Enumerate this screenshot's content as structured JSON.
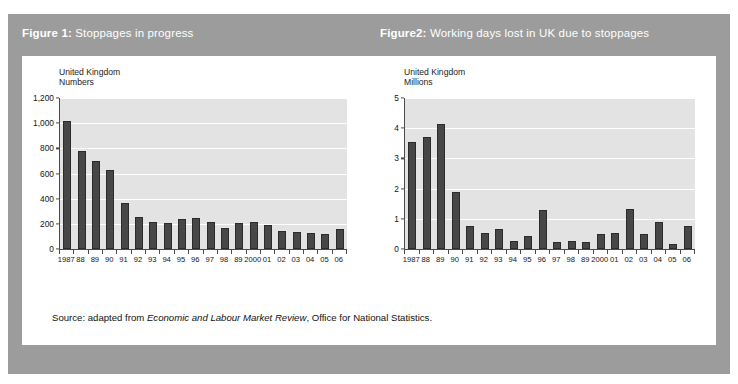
{
  "frame": {
    "bg_color": "#9c9c9c",
    "panel_color": "#ffffff"
  },
  "headers": {
    "figure1": {
      "lead": "Figure 1:",
      "rest": " Stoppages in progress"
    },
    "figure2": {
      "lead": "Figure2:",
      "rest": " Working days lost in UK due to stoppages"
    }
  },
  "source": {
    "prefix": "Source: adapted from ",
    "italic": "Economic and Labour Market Review",
    "suffix": ", Office for National Statistics."
  },
  "chart_data": [
    {
      "id": "chart1",
      "type": "bar",
      "title": "Figure 1: Stoppages in progress",
      "caption": "United Kingdom\nNumbers",
      "xlabel": "",
      "ylabel": "Numbers",
      "ylim": [
        0,
        1200
      ],
      "yticks": [
        0,
        200,
        400,
        600,
        800,
        1000,
        1200
      ],
      "ytick_labels": [
        "0",
        "200",
        "400",
        "600",
        "800",
        "1,000",
        "1,200"
      ],
      "grid": true,
      "legend": "none",
      "bar_color": "#474747",
      "plot_bg": "#e3e3e3",
      "categories": [
        "1987",
        "88",
        "89",
        "90",
        "91",
        "92",
        "93",
        "94",
        "95",
        "96",
        "97",
        "98",
        "89",
        "2000",
        "01",
        "02",
        "03",
        "04",
        "05",
        "06"
      ],
      "values": [
        1016,
        781,
        701,
        630,
        369,
        253,
        211,
        205,
        235,
        244,
        216,
        166,
        205,
        212,
        194,
        146,
        133,
        130,
        116,
        158
      ]
    },
    {
      "id": "chart2",
      "type": "bar",
      "title": "Figure2: Working days lost in UK due to stoppages",
      "caption": "United Kingdom\nMillions",
      "xlabel": "",
      "ylabel": "Millions",
      "ylim": [
        0,
        5
      ],
      "yticks": [
        0,
        1,
        2,
        3,
        4,
        5
      ],
      "ytick_labels": [
        "0",
        "1",
        "2",
        "3",
        "4",
        "5"
      ],
      "grid": true,
      "legend": "none",
      "bar_color": "#474747",
      "plot_bg": "#e3e3e3",
      "categories": [
        "1987",
        "88",
        "89",
        "90",
        "91",
        "92",
        "93",
        "94",
        "95",
        "96",
        "97",
        "98",
        "89",
        "2000",
        "01",
        "02",
        "03",
        "04",
        "05",
        "06"
      ],
      "values": [
        3.55,
        3.7,
        4.13,
        1.9,
        0.76,
        0.53,
        0.65,
        0.28,
        0.42,
        1.3,
        0.23,
        0.28,
        0.24,
        0.5,
        0.53,
        1.32,
        0.5,
        0.9,
        0.16,
        0.75
      ]
    }
  ]
}
